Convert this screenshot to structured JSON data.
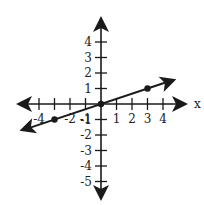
{
  "chart_data": {
    "type": "line",
    "title": "",
    "xlabel": "x",
    "ylabel": "",
    "xlim": [
      -4.5,
      4.5
    ],
    "ylim": [
      -5.5,
      4.5
    ],
    "grid": false,
    "x_ticks": [
      -4,
      -3,
      -2,
      -1,
      1,
      2,
      3,
      4
    ],
    "x_tick_labels": [
      "-4",
      "-2",
      "-1",
      "1",
      "2",
      "3",
      "4"
    ],
    "y_ticks": [
      4,
      3,
      2,
      1,
      -1,
      -2,
      -3,
      -4,
      -5
    ],
    "y_tick_labels": [
      "4",
      "3",
      "2",
      "1",
      "-1",
      "-2",
      "-3",
      "-4",
      "-5"
    ],
    "series": [
      {
        "name": "line",
        "equation": "y = x/3",
        "slope": 0.3333,
        "intercept": 0,
        "points": [
          {
            "x": -3,
            "y": -1
          },
          {
            "x": 0,
            "y": 0
          },
          {
            "x": 3,
            "y": 1
          }
        ],
        "extends_both_directions": true
      }
    ],
    "axes_arrows": true
  },
  "colors": {
    "ink": "#1a1a1a",
    "background": "#ffffff"
  }
}
